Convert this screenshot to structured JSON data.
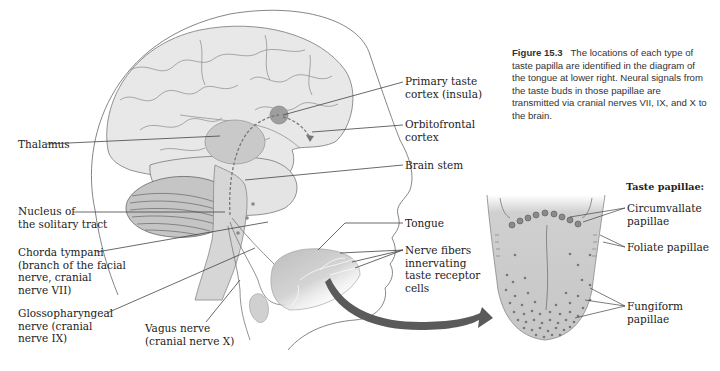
{
  "figure": {
    "number_label": "Figure 15.3",
    "caption": "The locations of each type of taste papilla are identified in the diagram of the tongue at lower right. Neural signals from the taste buds in those papillae are transmitted via cranial nerves VII, IX, and X to the brain."
  },
  "brain_labels": {
    "primary_taste_cortex": "Primary taste\ncortex (insula)",
    "orbitofrontal_cortex": "Orbitofrontal\ncortex",
    "thalamus": "Thalamus",
    "brain_stem": "Brain stem",
    "nucleus_solitary_tract": "Nucleus of\nthe solitary tract",
    "chorda_tympani": "Chorda tympani\n(branch of the facial\nnerve, cranial\nnerve VII)",
    "glossopharyngeal": "Glossopharyngeal\nnerve (cranial\nnerve IX)",
    "vagus": "Vagus nerve\n(cranial nerve X)",
    "tongue": "Tongue",
    "nerve_fibers": "Nerve fibers\ninnervating\ntaste receptor\ncells"
  },
  "tongue_panel": {
    "title": "Taste papillae:",
    "circumvallate": "Circumvallate\npapillae",
    "foliate": "Foliate papillae",
    "fungiform": "Fungiform\npapillae"
  },
  "colors": {
    "brain_fill": "#e6e6e6",
    "region_fill": "#c8c8c8",
    "line": "#555555",
    "arrow": "#5a5a5a"
  }
}
